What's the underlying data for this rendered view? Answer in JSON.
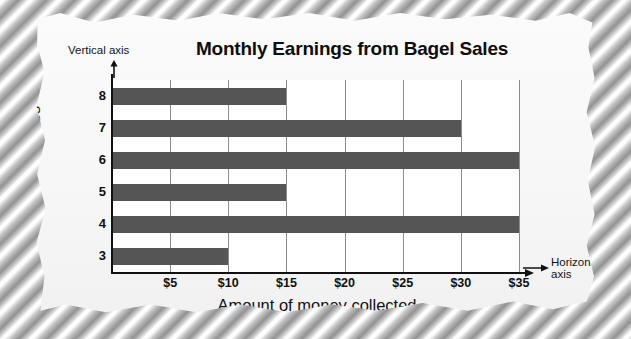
{
  "background": {
    "texture_name": "diagonal-rope-texture",
    "paper_color": "#f7f7f7"
  },
  "annotations": {
    "vertical_axis_note": "Vertical axis",
    "horizontal_axis_note_line1": "Horizontal",
    "horizontal_axis_note_line2": "axis",
    "vertical_arrow_icon": "arrow-down-icon",
    "horizontal_arrow_icon": "arrow-right-icon"
  },
  "chart_data": {
    "type": "bar",
    "orientation": "horizontal",
    "title": "Monthly Earnings from Bagel Sales",
    "xlabel": "Amount of money collected",
    "ylabel": "Grades",
    "categories": [
      "8",
      "7",
      "6",
      "5",
      "4",
      "3"
    ],
    "values": [
      15,
      30,
      35,
      15,
      35,
      10
    ],
    "xticks": [
      5,
      10,
      15,
      20,
      25,
      30,
      35
    ],
    "xtick_labels": [
      "$5",
      "$10",
      "$15",
      "$20",
      "$25",
      "$30",
      "$35"
    ],
    "xlim": [
      0,
      35
    ],
    "grid": "vertical",
    "legend": "none",
    "bar_color": "#555555",
    "axis_color": "#111111",
    "gridline_color": "#8c8c8c",
    "plot_background": "#ffffff"
  }
}
